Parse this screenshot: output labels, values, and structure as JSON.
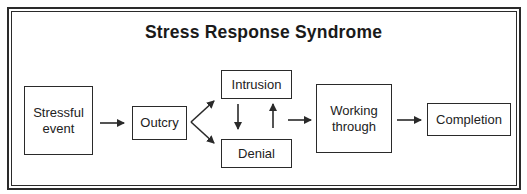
{
  "diagram": {
    "title": "Stress Response Syndrome",
    "nodes": {
      "stressful_event": "Stressful\nevent",
      "outcry": "Outcry",
      "intrusion": "Intrusion",
      "denial": "Denial",
      "working_through": "Working\nthrough",
      "completion": "Completion"
    },
    "edges": [
      {
        "from": "Stressful event",
        "to": "Outcry"
      },
      {
        "from": "Outcry",
        "to": "Intrusion"
      },
      {
        "from": "Outcry",
        "to": "Denial"
      },
      {
        "from": "Intrusion",
        "to": "Denial"
      },
      {
        "from": "Denial",
        "to": "Intrusion"
      },
      {
        "from": "Intrusion/Denial",
        "to": "Working through"
      },
      {
        "from": "Working through",
        "to": "Completion"
      }
    ],
    "colors": {
      "line": "#2a2a2a",
      "background": "#ffffff"
    }
  }
}
